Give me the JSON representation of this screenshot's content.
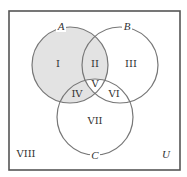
{
  "diagram": {
    "type": "venn-3-set",
    "universe_label": "U",
    "colors": {
      "background": "#ffffff",
      "border": "#555555",
      "circle_stroke": "#777777",
      "shade": "#e3e3e3",
      "text": "#333333"
    },
    "frame": {
      "x": 9,
      "y": 11,
      "width": 171,
      "height": 159
    },
    "sets": [
      {
        "id": "A",
        "label": "A",
        "cx": 70,
        "cy": 65,
        "r": 38,
        "label_x": 61,
        "label_y": 30
      },
      {
        "id": "B",
        "label": "B",
        "cx": 120,
        "cy": 65,
        "r": 38,
        "label_x": 127,
        "label_y": 30
      },
      {
        "id": "C",
        "label": "C",
        "cx": 95,
        "cy": 117,
        "r": 38,
        "label_x": 95,
        "label_y": 159
      }
    ],
    "shaded_regions": [
      "I",
      "II",
      "IV"
    ],
    "regions": [
      {
        "id": "I",
        "label": "I",
        "x": 58,
        "y": 67,
        "description": "A only"
      },
      {
        "id": "II",
        "label": "II",
        "x": 95,
        "y": 67,
        "description": "A and B only"
      },
      {
        "id": "III",
        "label": "III",
        "x": 131,
        "y": 67,
        "description": "B only"
      },
      {
        "id": "IV",
        "label": "IV",
        "x": 77,
        "y": 97,
        "description": "A and C only"
      },
      {
        "id": "V",
        "label": "V",
        "x": 95,
        "y": 87,
        "description": "A, B and C"
      },
      {
        "id": "VI",
        "label": "VI",
        "x": 114,
        "y": 97,
        "description": "B and C only"
      },
      {
        "id": "VII",
        "label": "VII",
        "x": 95,
        "y": 124,
        "description": "C only"
      },
      {
        "id": "VIII",
        "label": "VIII",
        "x": 26,
        "y": 157,
        "description": "outside A, B and C"
      }
    ],
    "universe_label_pos": {
      "x": 166,
      "y": 158
    }
  }
}
